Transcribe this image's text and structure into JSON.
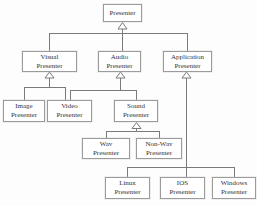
{
  "diagram": {
    "type": "uml-class-inheritance-diagram",
    "colors": {
      "background": "#fdfdfd",
      "box_fill": "#ffffff",
      "box_border": "#9b9b9b",
      "line": "#7a7a7a",
      "text": "#333333"
    },
    "nodes": {
      "presenter": {
        "label": "Presenter"
      },
      "visual": {
        "label": "Visual\nPresenter"
      },
      "audio": {
        "label": "Audio\nPresenter"
      },
      "application": {
        "label": "Application\nPresenter"
      },
      "image": {
        "label": "Image\nPresenter"
      },
      "video": {
        "label": "Video\nPresenter"
      },
      "sound": {
        "label": "Sound\nPresenter"
      },
      "wav": {
        "label": "Wav\nPresenter"
      },
      "nonwav": {
        "label": "Non-Wav\nPresenter"
      },
      "linux": {
        "label": "Linux\nPresenter"
      },
      "ios": {
        "label": "IOS\nPresenter"
      },
      "windows": {
        "label": "Windows\nPresenter"
      }
    },
    "edges": [
      {
        "from": "Visual Presenter",
        "to": "Presenter",
        "type": "generalization"
      },
      {
        "from": "Audio Presenter",
        "to": "Presenter",
        "type": "generalization"
      },
      {
        "from": "Application Presenter",
        "to": "Presenter",
        "type": "generalization"
      },
      {
        "from": "Image Presenter",
        "to": "Visual Presenter",
        "type": "generalization"
      },
      {
        "from": "Video Presenter",
        "to": "Visual Presenter",
        "type": "generalization"
      },
      {
        "from": "Video Presenter",
        "to": "Audio Presenter",
        "type": "generalization"
      },
      {
        "from": "Sound Presenter",
        "to": "Audio Presenter",
        "type": "generalization"
      },
      {
        "from": "Wav Presenter",
        "to": "Sound Presenter",
        "type": "generalization"
      },
      {
        "from": "Non-Wav Presenter",
        "to": "Sound Presenter",
        "type": "generalization"
      },
      {
        "from": "Linux Presenter",
        "to": "Application Presenter",
        "type": "generalization"
      },
      {
        "from": "IOS Presenter",
        "to": "Application Presenter",
        "type": "generalization"
      },
      {
        "from": "Windows Presenter",
        "to": "Application Presenter",
        "type": "generalization"
      }
    ]
  }
}
